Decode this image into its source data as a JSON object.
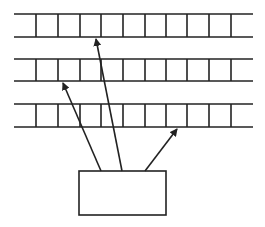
{
  "diagram": {
    "stroke_color": "#222222",
    "background": "#ffffff",
    "rows": [
      {
        "id": "row-1",
        "top": 14,
        "bottom": 37
      },
      {
        "id": "row-2",
        "top": 59,
        "bottom": 81
      },
      {
        "id": "row-3",
        "top": 104,
        "bottom": 127
      }
    ],
    "row_x_start": 14,
    "row_x_end": 253,
    "cell_dividers_x": [
      36,
      58,
      80,
      101,
      123,
      145,
      166,
      187,
      209,
      231
    ],
    "box": {
      "x": 79,
      "y": 171,
      "width": 87,
      "height": 44
    },
    "arrows": [
      {
        "id": "arrow-to-row-2",
        "from": [
          101,
          171
        ],
        "to": [
          63,
          83
        ]
      },
      {
        "id": "arrow-to-row-1",
        "from": [
          122,
          171
        ],
        "to": [
          96,
          39
        ]
      },
      {
        "id": "arrow-to-row-3",
        "from": [
          145,
          171
        ],
        "to": [
          177,
          129
        ]
      }
    ]
  }
}
